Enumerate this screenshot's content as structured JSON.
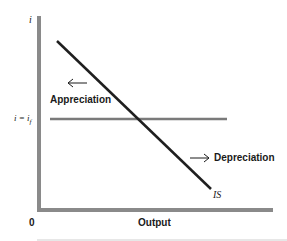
{
  "diagram": {
    "y_axis_label": "i",
    "x_axis_label": "Output",
    "origin_label": "0",
    "rate_label": "i = i",
    "rate_label_sub": "f",
    "curve_label": "IS",
    "left_arrow_label": "Appreciation",
    "right_arrow_label": "Depreciation",
    "colors": {
      "axis": "#8a8a8a",
      "is_curve": "#1f1f1f",
      "rate_line": "#7a7a7a",
      "text": "#1a1a1a"
    }
  }
}
